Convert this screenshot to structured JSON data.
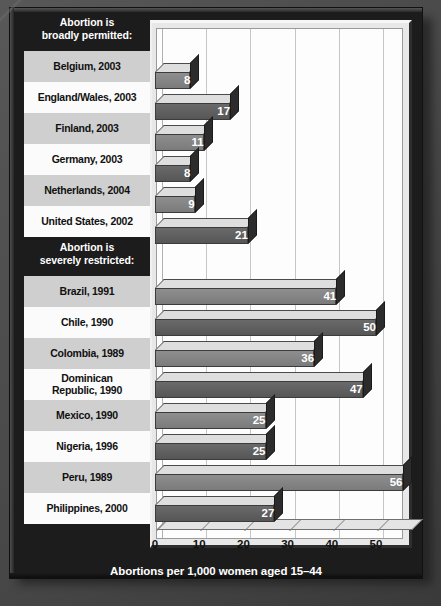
{
  "chart_data": {
    "type": "bar",
    "orientation": "horizontal",
    "title": "",
    "xlabel": "Abortions per 1,000 women aged 15–44",
    "ylabel": "",
    "xlim": [
      0,
      60
    ],
    "xticks": [
      0,
      10,
      20,
      30,
      40,
      50
    ],
    "xtick_labels": [
      "0",
      "10",
      "20",
      "30",
      "40",
      "50"
    ],
    "grid": true,
    "legend": false,
    "groups": [
      {
        "heading_line1": "Abortion is",
        "heading_line2": "broadly permitted:",
        "categories": [
          "Belgium, 2003",
          "England/Wales, 2003",
          "Finland, 2003",
          "Germany, 2003",
          "Netherlands, 2004",
          "United States, 2002"
        ],
        "values": [
          8,
          17,
          11,
          8,
          9,
          21
        ]
      },
      {
        "heading_line1": "Abortion is",
        "heading_line2": "severely restricted:",
        "categories": [
          "Brazil, 1991",
          "Chile, 1990",
          "Colombia, 1989",
          "Dominican Republic, 1990",
          "Mexico, 1990",
          "Nigeria, 1996",
          "Peru, 1989",
          "Philippines, 2000"
        ],
        "values": [
          41,
          50,
          36,
          47,
          25,
          25,
          56,
          27
        ]
      }
    ],
    "categories": [
      "Belgium, 2003",
      "England/Wales, 2003",
      "Finland, 2003",
      "Germany, 2003",
      "Netherlands, 2004",
      "United States, 2002",
      "Brazil, 1991",
      "Chile, 1990",
      "Colombia, 1989",
      "Dominican Republic, 1990",
      "Mexico, 1990",
      "Nigeria, 1996",
      "Peru, 1989",
      "Philippines, 2000"
    ],
    "values": [
      8,
      17,
      11,
      8,
      9,
      21,
      41,
      50,
      36,
      47,
      25,
      25,
      56,
      27
    ]
  },
  "rows": [
    {
      "kind": "heading",
      "line1": "Abortion is",
      "line2": "broadly permitted:"
    },
    {
      "kind": "bar",
      "label_line1": "Belgium, 2003",
      "label_line2": "",
      "value": 8,
      "value_text": "8"
    },
    {
      "kind": "bar",
      "label_line1": "England/Wales, 2003",
      "label_line2": "",
      "value": 17,
      "value_text": "17"
    },
    {
      "kind": "bar",
      "label_line1": "Finland, 2003",
      "label_line2": "",
      "value": 11,
      "value_text": "11"
    },
    {
      "kind": "bar",
      "label_line1": "Germany, 2003",
      "label_line2": "",
      "value": 8,
      "value_text": "8"
    },
    {
      "kind": "bar",
      "label_line1": "Netherlands, 2004",
      "label_line2": "",
      "value": 9,
      "value_text": "9"
    },
    {
      "kind": "bar",
      "label_line1": "United States, 2002",
      "label_line2": "",
      "value": 21,
      "value_text": "21"
    },
    {
      "kind": "heading",
      "line1": "Abortion is",
      "line2": "severely restricted:"
    },
    {
      "kind": "bar",
      "label_line1": "Brazil, 1991",
      "label_line2": "",
      "value": 41,
      "value_text": "41"
    },
    {
      "kind": "bar",
      "label_line1": "Chile, 1990",
      "label_line2": "",
      "value": 50,
      "value_text": "50"
    },
    {
      "kind": "bar",
      "label_line1": "Colombia, 1989",
      "label_line2": "",
      "value": 36,
      "value_text": "36"
    },
    {
      "kind": "bar",
      "label_line1": "Dominican",
      "label_line2": "Republic, 1990",
      "value": 47,
      "value_text": "47"
    },
    {
      "kind": "bar",
      "label_line1": "Mexico, 1990",
      "label_line2": "",
      "value": 25,
      "value_text": "25"
    },
    {
      "kind": "bar",
      "label_line1": "Nigeria, 1996",
      "label_line2": "",
      "value": 25,
      "value_text": "25"
    },
    {
      "kind": "bar",
      "label_line1": "Peru, 1989",
      "label_line2": "",
      "value": 56,
      "value_text": "56"
    },
    {
      "kind": "bar",
      "label_line1": "Philippines, 2000",
      "label_line2": "",
      "value": 27,
      "value_text": "27"
    }
  ],
  "axis": {
    "ticks": [
      "0",
      "10",
      "20",
      "30",
      "40",
      "50"
    ],
    "tick_values": [
      0,
      10,
      20,
      30,
      40,
      50
    ]
  },
  "caption": "Abortions per 1,000 women aged 15–44",
  "colors": {
    "background": "#4a4a4a",
    "board": "#1c1c1c",
    "panel_light": "#fdfdfd",
    "label_shade_a": "#cfcfcf",
    "label_shade_b": "#fbfbfb",
    "bar_tone_a": "#8e8e8e",
    "bar_tone_b": "#6a6a6a",
    "bar_top": "#dedede",
    "bar_side": "#2c2c2c",
    "heading_text": "#ffffff",
    "label_text": "#111111",
    "value_text": "#ffffff",
    "gridline": "#c6c6c6"
  }
}
